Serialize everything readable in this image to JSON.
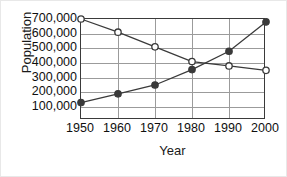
{
  "chart_data": {
    "type": "line",
    "title": "",
    "xlabel": "Year",
    "ylabel": "Population",
    "categories": [
      "1950",
      "1960",
      "1970",
      "1980",
      "1990",
      "2000"
    ],
    "x": [
      1950,
      1960,
      1970,
      1980,
      1990,
      2000
    ],
    "xlim": [
      1950,
      2000
    ],
    "ylim": [
      100000,
      700000
    ],
    "ytick_labels": [
      "700,000",
      "600,000",
      "500,000",
      "400,000",
      "300,000",
      "200,000",
      "100,000"
    ],
    "ytick_values": [
      700000,
      600000,
      500000,
      400000,
      300000,
      200000,
      100000
    ],
    "grid": true,
    "legend": "none",
    "series": [
      {
        "name": "declining-population",
        "marker": "open-circle",
        "color": "#3a3a3a",
        "values": [
          700000,
          610000,
          510000,
          410000,
          380000,
          350000
        ]
      },
      {
        "name": "rising-population",
        "marker": "filled-circle",
        "color": "#3a3a3a",
        "values": [
          130000,
          190000,
          250000,
          355000,
          480000,
          680000
        ]
      }
    ],
    "annotations": []
  },
  "axes": {
    "y_title": "Population",
    "x_title": "Year"
  }
}
